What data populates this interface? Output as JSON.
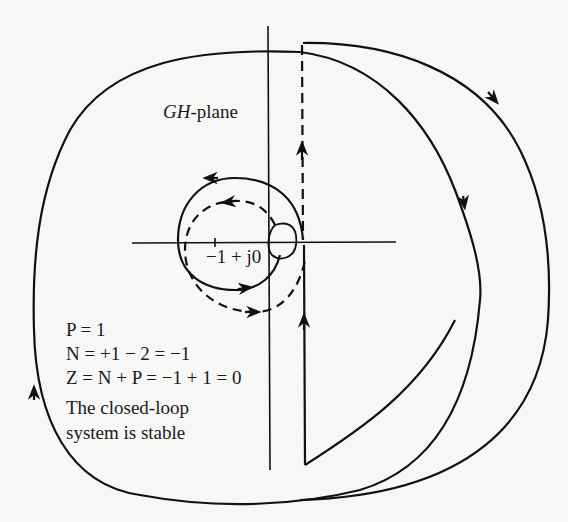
{
  "diagram": {
    "type": "nyquist-plot",
    "plane_label_italic": "GH",
    "plane_label_suffix": "-plane",
    "critical_point": "−1 + j0",
    "equations": {
      "p_line": "P = 1",
      "n_line": "N = +1 − 2 = −1",
      "z_line": "Z = N + P = −1 + 1 = 0"
    },
    "conclusion": {
      "line1": "The closed-loop",
      "line2": "system is stable"
    },
    "colors": {
      "ink": "#111111",
      "paper": "#f7f7f5"
    }
  }
}
